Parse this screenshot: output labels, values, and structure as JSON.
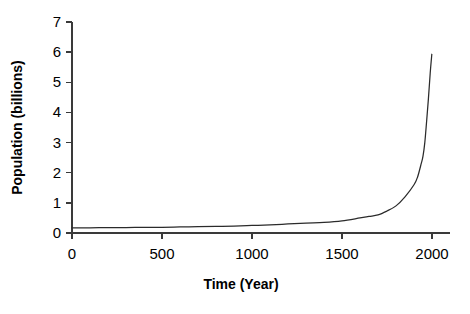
{
  "chart_data": {
    "type": "line",
    "title": "",
    "xlabel": "Time (Year)",
    "ylabel": "Population (billions)",
    "xlim": [
      0,
      2100
    ],
    "ylim": [
      0,
      7
    ],
    "xticks": [
      0,
      500,
      1000,
      1500,
      2000
    ],
    "xtick_labels": [
      "0",
      "500",
      "1000",
      "1500",
      "2000"
    ],
    "yticks": [
      0,
      1,
      2,
      3,
      4,
      5,
      6,
      7
    ],
    "ytick_labels": [
      "0",
      "1",
      "2",
      "3",
      "4",
      "5",
      "6",
      "7"
    ],
    "grid": false,
    "legend": false,
    "series": [
      {
        "name": "World population",
        "color": "#2b2b2b",
        "x": [
          0,
          100,
          200,
          300,
          400,
          500,
          600,
          700,
          800,
          900,
          1000,
          1100,
          1200,
          1300,
          1400,
          1500,
          1600,
          1650,
          1700,
          1750,
          1800,
          1850,
          1900,
          1920,
          1940,
          1950,
          1960,
          1970,
          1980,
          1990,
          1999
        ],
        "values": [
          0.17,
          0.17,
          0.18,
          0.18,
          0.19,
          0.19,
          0.2,
          0.21,
          0.22,
          0.23,
          0.25,
          0.27,
          0.3,
          0.33,
          0.35,
          0.4,
          0.5,
          0.55,
          0.6,
          0.73,
          0.9,
          1.2,
          1.6,
          1.86,
          2.3,
          2.55,
          3.0,
          3.7,
          4.45,
          5.3,
          5.93
        ]
      }
    ]
  },
  "axes": {
    "x_title": "Time (Year)",
    "y_title": "Population (billions)"
  }
}
